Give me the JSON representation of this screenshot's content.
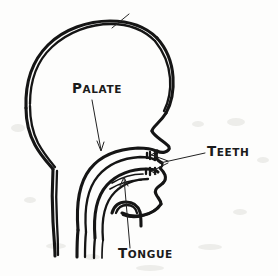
{
  "figure": {
    "kind": "hand-drawn sagittal cross-section of a human head",
    "ink_color": "#151515",
    "background_color": "#fdfdfc",
    "width": 278,
    "height": 276
  },
  "labels": {
    "palate": {
      "text": "PALATE",
      "small_text": "ALATE",
      "initial": "P",
      "x": 72,
      "y": 93
    },
    "teeth": {
      "text": "TEETH",
      "small_text": "EETH",
      "initial": "T",
      "x": 207,
      "y": 156
    },
    "tongue": {
      "text": "TONGUE",
      "small_text": "ONGUE",
      "initial": "T",
      "x": 118,
      "y": 258
    }
  },
  "annotations": [
    {
      "name": "palate-leader",
      "from_label": "palate",
      "points_to": "hard palate, roof of the mouth"
    },
    {
      "name": "teeth-leader-upper",
      "from_label": "teeth",
      "points_to": "upper incisors"
    },
    {
      "name": "teeth-leader-lower",
      "from_label": "teeth",
      "points_to": "lower incisors"
    },
    {
      "name": "tongue-leader",
      "from_label": "tongue",
      "points_to": "body of the tongue"
    }
  ],
  "anatomy_parts": [
    "skull outline",
    "forehead",
    "nose profile",
    "upper lip",
    "lower lip",
    "chin",
    "jaw line",
    "neck",
    "hard palate",
    "soft palate",
    "tongue",
    "pharynx",
    "upper teeth",
    "lower teeth"
  ]
}
